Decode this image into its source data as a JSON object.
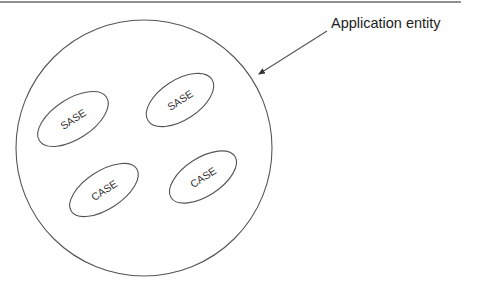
{
  "diagram": {
    "caption": "Application entity",
    "elements": [
      {
        "id": "sase-1",
        "label": "SASE",
        "cx": 73,
        "cy": 119,
        "rx": 40,
        "ry": 20,
        "rotate": -33
      },
      {
        "id": "sase-2",
        "label": "SASE",
        "cx": 180,
        "cy": 100,
        "rx": 38,
        "ry": 20,
        "rotate": -33
      },
      {
        "id": "case-1",
        "label": "CASE",
        "cx": 104,
        "cy": 190,
        "rx": 39,
        "ry": 19,
        "rotate": -33
      },
      {
        "id": "case-2",
        "label": "CASE",
        "cx": 203,
        "cy": 177,
        "rx": 38,
        "ry": 19,
        "rotate": -33
      }
    ],
    "container": {
      "shape": "circle",
      "cx": 144,
      "cy": 148,
      "r": 128
    },
    "pointer": {
      "from": [
        327,
        31
      ],
      "to": [
        258,
        75
      ]
    },
    "colors": {
      "line": "#555555",
      "text": "#222222",
      "background": "#ffffff"
    }
  }
}
